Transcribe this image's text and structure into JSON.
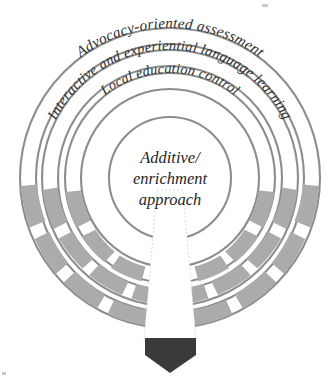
{
  "diagram": {
    "type": "concentric-ring-diagram",
    "center": {
      "line1": "Additive/",
      "line2": "enrichment",
      "line3": "approach"
    },
    "rings": [
      {
        "index": 1,
        "position": "outer",
        "label": "Advocacy-oriented assessment"
      },
      {
        "index": 2,
        "position": "middle",
        "label": "Interactive and experiential language learning"
      },
      {
        "index": 3,
        "position": "inner",
        "label": "Local education control"
      }
    ],
    "colors": {
      "background": "#ffffff",
      "ring_stroke": "#8d8d8d",
      "band_fill": "#ababab",
      "arrow_fill": "#3a3a3a",
      "text": "#2e2e2e"
    },
    "arrow": {
      "name": "downward-pointing-arrow",
      "direction": "down"
    }
  }
}
